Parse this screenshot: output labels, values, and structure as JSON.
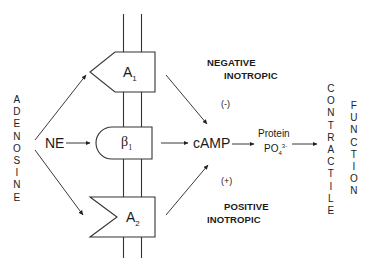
{
  "diagram": {
    "left_vertical_label": "ADENOSINE",
    "right_vertical_label_1": "CONTRACTILE",
    "right_vertical_label_2": "FUNCTION",
    "agonist_label": "NE",
    "receptors": {
      "a1": {
        "name": "A",
        "sub": "1"
      },
      "beta1": {
        "name": "β",
        "sub": "1"
      },
      "a2": {
        "name": "A",
        "sub": "2"
      }
    },
    "second_messenger": "cAMP",
    "protein_label": "Protein",
    "po4_label": "PO",
    "po4_sub": "4",
    "po4_sup": "3-",
    "negative": {
      "line1": "NEGATIVE",
      "line2": "INOTROPIC",
      "sign": "(-)"
    },
    "positive": {
      "line1": "POSITIVE",
      "line2": "INOTROPIC",
      "sign": "(+)"
    }
  }
}
